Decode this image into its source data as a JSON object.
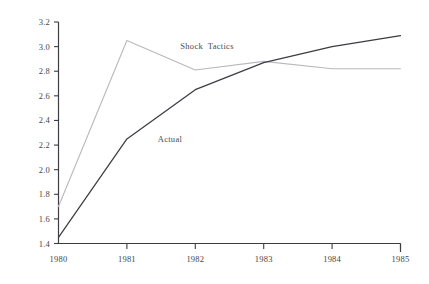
{
  "chart_data": {
    "type": "line",
    "title": "",
    "subtitle": "",
    "xlabel": "",
    "ylabel": "",
    "x": [
      1980,
      1981,
      1982,
      1983,
      1984,
      1985
    ],
    "xtick_labels": [
      "1980",
      "1981",
      "1982",
      "1983",
      "1984",
      "1985"
    ],
    "ytick_labels": [
      "1.4",
      "1.6",
      "1.8",
      "2.0",
      "2.2",
      "2.4",
      "2.6",
      "2.8",
      "3.0",
      "3.2"
    ],
    "ytick_values": [
      1.4,
      1.6,
      1.8,
      2.0,
      2.2,
      2.4,
      2.6,
      2.8,
      3.0,
      3.2
    ],
    "xlim": [
      1980,
      1985
    ],
    "ylim": [
      1.4,
      3.2
    ],
    "grid": false,
    "legend_position": "inline-annotations",
    "series": [
      {
        "name": "Shock Tactics",
        "values": [
          1.7,
          3.05,
          2.81,
          2.88,
          2.82,
          2.82
        ],
        "color": "#b9b9bd",
        "style": "solid-light",
        "annotation": "Shock  Tactics",
        "annotation_x": 1981.78,
        "annotation_y": 3.0
      },
      {
        "name": "Actual",
        "values": [
          1.45,
          2.25,
          2.65,
          2.87,
          3.0,
          3.09
        ],
        "color": "#3c3c42",
        "style": "solid-dark",
        "annotation": "Actual",
        "annotation_x": 1981.45,
        "annotation_y": 2.24
      }
    ]
  },
  "axes": {
    "y_axis_name": "value-axis",
    "x_axis_name": "year-axis"
  }
}
